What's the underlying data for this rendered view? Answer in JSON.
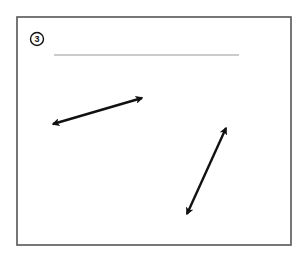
{
  "worksheet": {
    "item_number": "3",
    "answer_line": {
      "x1": 54,
      "y1": 55,
      "x2": 239,
      "y2": 55,
      "color": "#9a9a9a"
    },
    "frame": {
      "x": 17,
      "y": 17,
      "width": 274,
      "height": 228,
      "color": "#555555"
    },
    "badge": {
      "cx": 37,
      "cy": 39,
      "r": 6.5
    },
    "arrows": [
      {
        "name": "double-arrow-shallow",
        "x1": 50,
        "y1": 125,
        "x2": 145,
        "y2": 97
      },
      {
        "name": "double-arrow-steep",
        "x1": 186,
        "y1": 217,
        "x2": 227,
        "y2": 125
      }
    ],
    "colors": {
      "arrow": "#111111",
      "background": "#ffffff"
    }
  }
}
